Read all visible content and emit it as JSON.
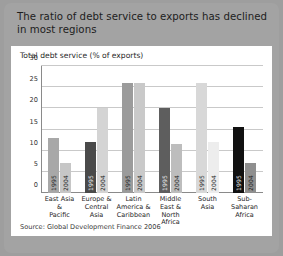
{
  "header": {
    "title": "The ratio of debt service to exports has declined in most regions"
  },
  "panel": {
    "subtitle": "Total debt service (% of exports)",
    "source": "Source: Global Development Finance 2006"
  },
  "chart_data": {
    "type": "bar",
    "title": "The ratio of debt service to exports has declined in most regions",
    "subtitle": "Total debt service (% of exports)",
    "xlabel": "",
    "ylabel": "Total debt service (% of exports)",
    "ylim": [
      0,
      30
    ],
    "yticks": [
      0,
      5,
      10,
      15,
      20,
      25,
      30
    ],
    "grid": true,
    "legend": "none",
    "categories": [
      "East Asia & Pacific",
      "Europe & Central Asia",
      "Latin America & Caribbean",
      "Middle East & North Africa",
      "South Asia",
      "Sub-Saharan Africa"
    ],
    "series": [
      {
        "name": "1995",
        "values": [
          13,
          12,
          26,
          20,
          26,
          15.5
        ]
      },
      {
        "name": "2004",
        "values": [
          7,
          20,
          26,
          11.5,
          12,
          7
        ]
      }
    ],
    "bar_colors": [
      [
        "#a8a8a8",
        "#c6c6c6"
      ],
      [
        "#4a4a4a",
        "#d4d4d4"
      ],
      [
        "#9b9b9b",
        "#c9c9c9"
      ],
      [
        "#5e5e5e",
        "#bdbdbd"
      ],
      [
        "#d8d8d8",
        "#ededed"
      ],
      [
        "#111111",
        "#8f8f8f"
      ]
    ],
    "annotations": []
  },
  "xlabels": [
    {
      "l1": "East Asia &",
      "l2": "Pacific",
      "l3": ""
    },
    {
      "l1": "Europe &",
      "l2": "Central",
      "l3": "Asia"
    },
    {
      "l1": "Latin",
      "l2": "America &",
      "l3": "Caribbean"
    },
    {
      "l1": "Middle East &",
      "l2": "North",
      "l3": "Africa"
    },
    {
      "l1": "South",
      "l2": "Asia",
      "l3": ""
    },
    {
      "l1": "Sub-",
      "l2": "Saharan",
      "l3": "Africa"
    }
  ]
}
